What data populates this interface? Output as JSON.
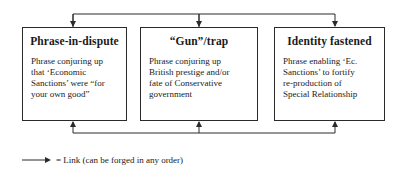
{
  "boxes": [
    {
      "title": "Phrase-in-dispute",
      "lines": [
        "Phrase conjuring up",
        "that ‘Economic",
        "Sanctions’ were “for",
        "your own good”"
      ]
    },
    {
      "title": "“Gun”/trap",
      "lines": [
        "Phrase conjuring up",
        "British prestige and/or",
        "fate of Conservative",
        "government"
      ]
    },
    {
      "title": "Identity fastened",
      "lines": [
        "Phrase enabling ‘Ec.",
        "Sanctions’ to fortify",
        "re-production of",
        "Special Relationship"
      ]
    }
  ],
  "legend": {
    "symbol": "arrow-icon",
    "text": "= Link (can be forged in any order)"
  },
  "colors": {
    "line": "#2a2a2a",
    "background": "#ffffff"
  }
}
